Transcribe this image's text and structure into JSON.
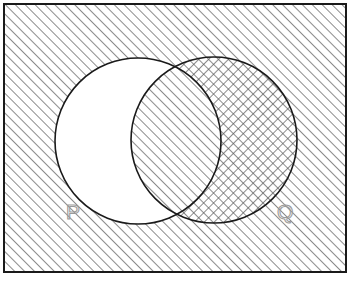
{
  "figure": {
    "width": 357,
    "height": 286,
    "background_color": "#ffffff"
  },
  "universal_set": {
    "name": "universal-set-rectangle",
    "shading": "diagonal-hatch-forward",
    "border_color": "#1a1a1a",
    "border_width": 2,
    "x": 4,
    "y": 4,
    "width": 342,
    "height": 268
  },
  "sets": [
    {
      "id": "P",
      "label": "P",
      "label_x": 66,
      "label_y": 219,
      "cx": 138,
      "cy": 141,
      "r": 83,
      "exclusive_shading": "none",
      "exclusive_fill": "#ffffff",
      "outline_color": "#1a1a1a"
    },
    {
      "id": "Q",
      "label": "Q",
      "label_x": 277,
      "label_y": 219,
      "cx": 214,
      "cy": 140,
      "r": 83,
      "exclusive_shading": "cross-hatch",
      "exclusive_fill": "#ffffff",
      "outline_color": "#1a1a1a"
    }
  ],
  "regions": [
    {
      "name": "outside-both",
      "description": "Universal set outside P and Q",
      "shading": "diagonal-hatch-forward"
    },
    {
      "name": "p-only",
      "description": "Elements in P but not in Q",
      "shading": "none"
    },
    {
      "name": "p-and-q-intersection",
      "description": "Elements in both P and Q",
      "shading": "diagonal-hatch-forward"
    },
    {
      "name": "q-only",
      "description": "Elements in Q but not in P",
      "shading": "cross-hatch"
    }
  ],
  "colors": {
    "hatch_line": "#5a5a5a",
    "outline": "#1a1a1a",
    "label_stroke": "#9a9a9a",
    "paper": "#ffffff"
  },
  "hatch": {
    "spacing": 7,
    "line_width": 1.4,
    "angle_forward_deg": 45,
    "angle_back_deg": 135
  }
}
